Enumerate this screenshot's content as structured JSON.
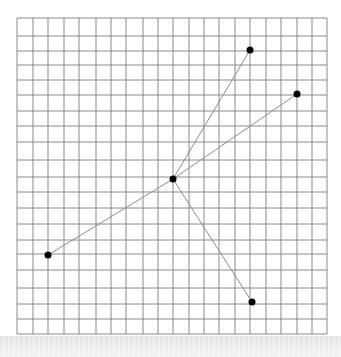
{
  "diagram": {
    "type": "star-graph-on-grid",
    "grid": {
      "columns": 20,
      "rows": 20,
      "x_lines_px": [
        17,
        33,
        48,
        64,
        79,
        96,
        111,
        126,
        143,
        158,
        173,
        189,
        204,
        219,
        235,
        250,
        266,
        281,
        297,
        312,
        327
      ],
      "y_lines_px": [
        18,
        36,
        51,
        65,
        80,
        95,
        111,
        126,
        142,
        160,
        177,
        192,
        208,
        224,
        240,
        254,
        270,
        288,
        304,
        319,
        334
      ],
      "line_color": "#8a8a8a",
      "background": "#ffffff"
    },
    "points": [
      {
        "id": "center",
        "col": 10,
        "row": 10,
        "x": 173,
        "y": 179
      },
      {
        "id": "upper-right-high",
        "col": 15,
        "row": 2,
        "x": 250,
        "y": 50
      },
      {
        "id": "upper-right-far",
        "col": 18,
        "row": 5,
        "x": 297,
        "y": 94
      },
      {
        "id": "lower-left",
        "col": 2,
        "row": 15,
        "x": 48,
        "y": 255
      },
      {
        "id": "lower-right",
        "col": 15,
        "row": 18,
        "x": 252,
        "y": 302
      }
    ],
    "edges": [
      {
        "from": "center",
        "to": "upper-right-high"
      },
      {
        "from": "center",
        "to": "upper-right-far"
      },
      {
        "from": "center",
        "to": "lower-left"
      },
      {
        "from": "center",
        "to": "lower-right"
      }
    ],
    "point_color": "#000000",
    "point_radius": 3.5,
    "edge_color": "#8c8c8c"
  }
}
